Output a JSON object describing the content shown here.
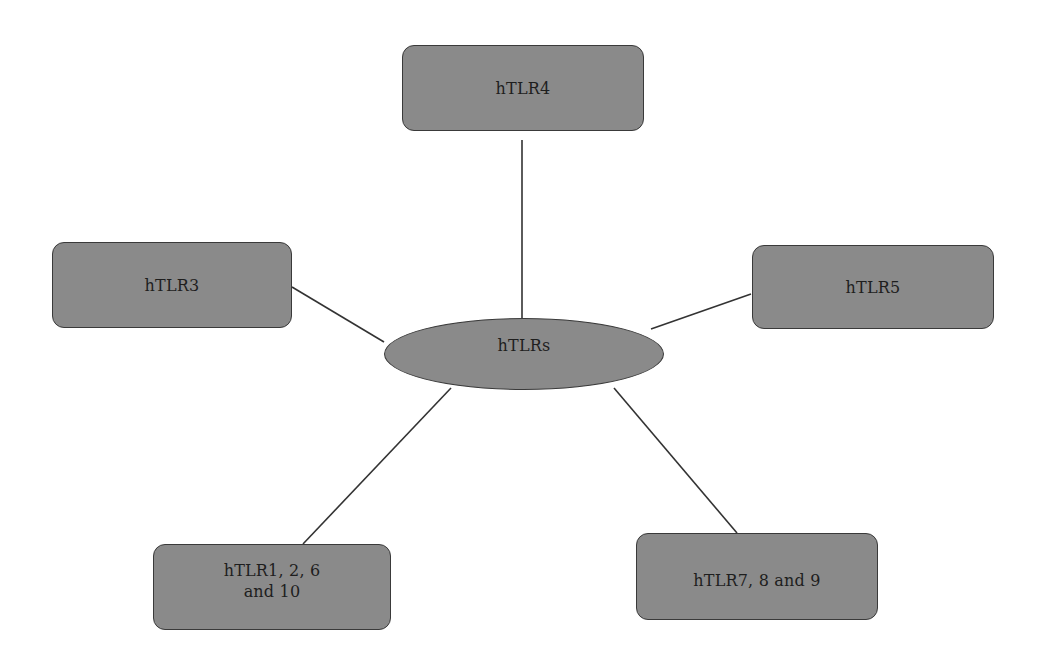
{
  "diagram": {
    "hub": {
      "label": "hTLRs"
    },
    "nodes": [
      {
        "id": "tlr4",
        "label": "hTLR4"
      },
      {
        "id": "tlr3",
        "label": "hTLR3"
      },
      {
        "id": "tlr5",
        "label": "hTLR5"
      },
      {
        "id": "tlr1-2-6-10",
        "label": "hTLR1, 2, 6\nand 10"
      },
      {
        "id": "tlr7-8-9",
        "label": "hTLR7, 8 and 9"
      }
    ],
    "colors": {
      "node_fill": "#8a8a8a",
      "node_border": "#3a3a3a",
      "edge": "#333333",
      "text": "#1e1e1e"
    }
  }
}
